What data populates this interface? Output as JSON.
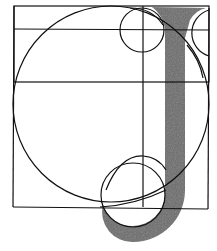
{
  "figure": {
    "title": "Geometric construction of the letter J",
    "letter": "J",
    "colors": {
      "background": "#ffffff",
      "line": "#111111",
      "fill": "#6b6b6b"
    },
    "elements": [
      "outer-square",
      "horizontal-guide",
      "vertical-guide",
      "large-circle",
      "small-top-circle",
      "top-right-circle",
      "hook-circle",
      "j-stem",
      "j-hook"
    ]
  }
}
